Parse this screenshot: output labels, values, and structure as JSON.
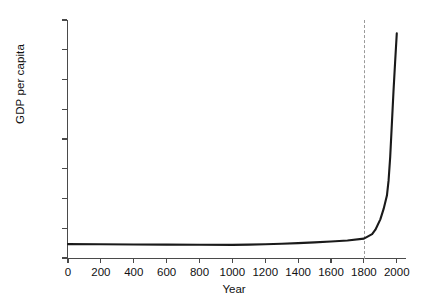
{
  "chart_data": {
    "type": "line",
    "title": "",
    "xlabel": "Year",
    "ylabel": "GDP per capita",
    "xlim": [
      0,
      2050
    ],
    "ylim": [
      0,
      8000
    ],
    "grid": false,
    "legend": null,
    "xticks": [
      0,
      200,
      400,
      600,
      800,
      1000,
      1200,
      1400,
      1600,
      1800,
      2000
    ],
    "xtick_labels": [
      "0",
      "200",
      "400",
      "600",
      "800",
      "1000",
      "1200",
      "1400",
      "1600",
      "1800",
      "2000"
    ],
    "yticks": [
      0,
      1000,
      2000,
      3000,
      4000,
      5000,
      6000,
      7000,
      8000
    ],
    "ytick_labels": [
      "0",
      "1,000",
      "2,000",
      "3,000",
      "4,000",
      "5,000",
      "6,000",
      "7,000",
      "8,000"
    ],
    "annotations": [
      {
        "kind": "vertical-dashed-line",
        "x": 1800,
        "label": ""
      }
    ],
    "series": [
      {
        "name": "GDP per capita",
        "color": "#1a1a1a",
        "x": [
          0,
          200,
          400,
          600,
          800,
          1000,
          1100,
          1200,
          1300,
          1400,
          1500,
          1600,
          1700,
          1800,
          1850,
          1870,
          1900,
          1920,
          1940,
          1950,
          1960,
          1970,
          1980,
          1990,
          2000
        ],
        "y": [
          467,
          462,
          455,
          450,
          445,
          440,
          450,
          462,
          480,
          500,
          525,
          555,
          590,
          650,
          800,
          950,
          1300,
          1650,
          2100,
          2600,
          3400,
          4500,
          5600,
          6600,
          7550
        ]
      }
    ]
  },
  "axis": {
    "y_title": "GDP per capita",
    "x_title": "Year"
  }
}
